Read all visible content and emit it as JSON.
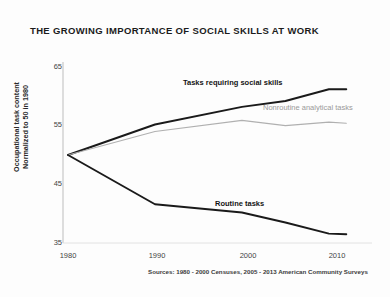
{
  "chart_data": {
    "type": "line",
    "title": "THE GROWING IMPORTANCE OF SOCIAL SKILLS AT WORK",
    "xlabel": "",
    "ylabel": "Occupational task content",
    "ylabel_line2": "Normalized to 50 in 1980",
    "xlim": [
      1980,
      2013
    ],
    "ylim": [
      35,
      65
    ],
    "yticks": [
      35,
      45,
      55,
      65
    ],
    "xticks": [
      1980,
      1990,
      2000,
      2010
    ],
    "grid": false,
    "legend_position": "inline-annotations",
    "source_note": "Sources: 1980 - 2000 Censuses, 2005 - 2013 American Community Surveys",
    "x": [
      1980,
      1990,
      2000,
      2005,
      2010,
      2012
    ],
    "series": [
      {
        "name": "Tasks requiring social skills",
        "color": "#1a1a1a",
        "values": [
          50.0,
          55.2,
          58.2,
          59.2,
          61.2,
          61.2
        ]
      },
      {
        "name": "Nonroutine analytical tasks",
        "color": "#b0b0b0",
        "values": [
          50.0,
          54.0,
          55.9,
          55.0,
          55.6,
          55.4
        ]
      },
      {
        "name": "Routine tasks",
        "color": "#1a1a1a",
        "values": [
          50.0,
          41.6,
          40.2,
          38.5,
          36.6,
          36.5
        ]
      }
    ]
  },
  "annotations": {
    "social_skills": "Tasks requiring social skills",
    "nonroutine": "Nonroutine analytical tasks",
    "routine": "Routine tasks"
  },
  "axis": {
    "y_tick_labels": [
      "65",
      "55",
      "45",
      "35"
    ],
    "x_tick_labels": [
      "1980",
      "1990",
      "2000",
      "2010"
    ]
  }
}
